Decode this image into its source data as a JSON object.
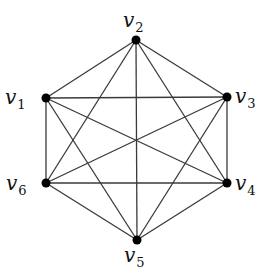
{
  "graph": {
    "name": "K6",
    "nodes": [
      {
        "id": "v1",
        "label": "v",
        "sub": "1",
        "x": 46,
        "y": 98,
        "lx": 5,
        "ly": 104
      },
      {
        "id": "v2",
        "label": "v",
        "sub": "2",
        "x": 136,
        "y": 40,
        "lx": 123,
        "ly": 27
      },
      {
        "id": "v3",
        "label": "v",
        "sub": "3",
        "x": 227,
        "y": 97,
        "lx": 235,
        "ly": 103
      },
      {
        "id": "v4",
        "label": "v",
        "sub": "4",
        "x": 227,
        "y": 183,
        "lx": 235,
        "ly": 190
      },
      {
        "id": "v5",
        "label": "v",
        "sub": "5",
        "x": 137,
        "y": 240,
        "lx": 124,
        "ly": 262
      },
      {
        "id": "v6",
        "label": "v",
        "sub": "6",
        "x": 46,
        "y": 183,
        "lx": 6,
        "ly": 190
      }
    ],
    "edges": [
      [
        "v1",
        "v2"
      ],
      [
        "v1",
        "v3"
      ],
      [
        "v1",
        "v4"
      ],
      [
        "v1",
        "v5"
      ],
      [
        "v1",
        "v6"
      ],
      [
        "v2",
        "v3"
      ],
      [
        "v2",
        "v4"
      ],
      [
        "v2",
        "v5"
      ],
      [
        "v2",
        "v6"
      ],
      [
        "v3",
        "v4"
      ],
      [
        "v3",
        "v5"
      ],
      [
        "v3",
        "v6"
      ],
      [
        "v4",
        "v5"
      ],
      [
        "v4",
        "v6"
      ],
      [
        "v5",
        "v6"
      ]
    ]
  }
}
